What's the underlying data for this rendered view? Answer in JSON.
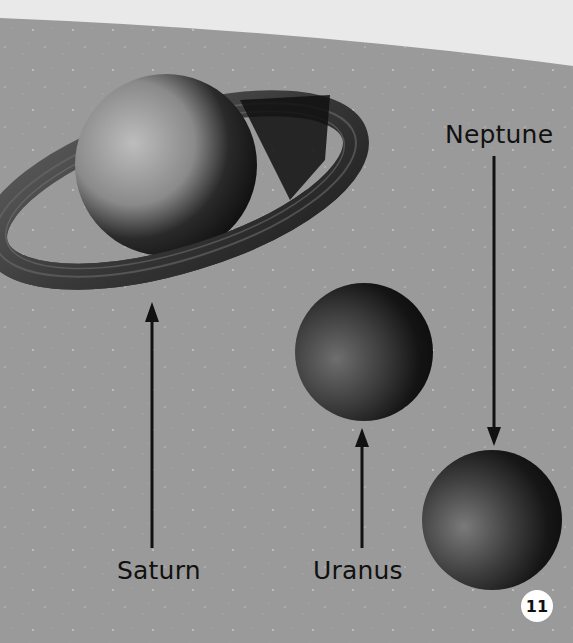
{
  "page": {
    "background_color": "#9a9a9a",
    "top_band_color": "#e9e9e9",
    "page_number": "11"
  },
  "planets": [
    {
      "name": "Saturn",
      "label": "Saturn",
      "has_rings": true
    },
    {
      "name": "Uranus",
      "label": "Uranus",
      "has_rings": false
    },
    {
      "name": "Neptune",
      "label": "Neptune",
      "has_rings": false
    }
  ]
}
